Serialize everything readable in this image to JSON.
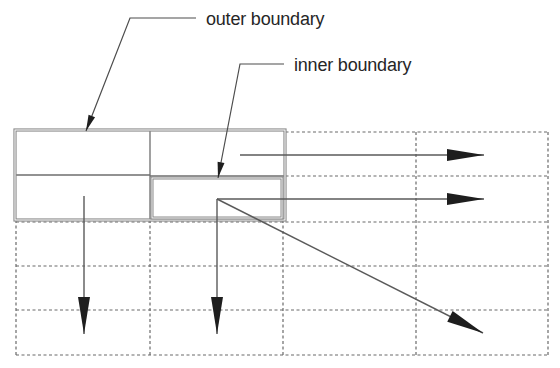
{
  "labels": {
    "outer": "outer boundary",
    "inner": "inner boundary"
  },
  "colors": {
    "text": "#262626",
    "boundary": "#8a8a8a",
    "grid": "#6a6a6a",
    "arrow": "#1e1e1e"
  },
  "grid": {
    "columns_x": [
      16,
      150,
      283,
      416,
      548
    ],
    "rows_y": [
      132,
      176,
      222,
      266,
      310,
      355
    ],
    "style": "dashed"
  },
  "outer_boundary": {
    "x": 15,
    "y": 130,
    "width": 270,
    "height": 90,
    "divider_x": 150,
    "divider_y": 175
  },
  "inner_boundary": {
    "x": 152,
    "y": 178,
    "width": 130,
    "height": 40
  },
  "leaders": [
    {
      "label_ref": "outer",
      "text_x": 206,
      "text_y": 10,
      "elbow": [
        130,
        18
      ],
      "end": [
        196,
        18
      ],
      "tip": [
        86,
        131
      ]
    },
    {
      "label_ref": "inner",
      "text_x": 294,
      "text_y": 56,
      "elbow": [
        240,
        64
      ],
      "end": [
        284,
        64
      ],
      "tip": [
        218,
        178
      ]
    }
  ],
  "arrows": [
    {
      "name": "arrow-right-top",
      "from": [
        240,
        155
      ],
      "to": [
        484,
        155
      ]
    },
    {
      "name": "arrow-right-middle",
      "from": [
        217,
        199
      ],
      "to": [
        484,
        199
      ]
    },
    {
      "name": "arrow-diagonal",
      "from": [
        217,
        199
      ],
      "to": [
        483,
        333
      ]
    },
    {
      "name": "arrow-down-left",
      "from": [
        84,
        196
      ],
      "to": [
        84,
        334
      ]
    },
    {
      "name": "arrow-down-middle",
      "from": [
        217,
        199
      ],
      "to": [
        217,
        334
      ]
    }
  ]
}
